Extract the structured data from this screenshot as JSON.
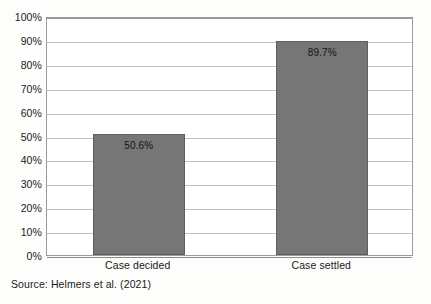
{
  "chart_data": {
    "type": "bar",
    "title": "",
    "subtitle": "",
    "xlabel": "",
    "ylabel": "",
    "categories": [
      "Case decided",
      "Case settled"
    ],
    "values": [
      50.6,
      89.7
    ],
    "data_labels": [
      "50.6%",
      "89.7%"
    ],
    "ylim": [
      0,
      100
    ],
    "y_tick_values": [
      0,
      10,
      20,
      30,
      40,
      50,
      60,
      70,
      80,
      90,
      100
    ],
    "y_tick_labels": [
      "0%",
      "10%",
      "20%",
      "30%",
      "40%",
      "50%",
      "60%",
      "70%",
      "80%",
      "90%",
      "100%"
    ],
    "grid": "horizontal",
    "legend": "none",
    "bar_color": "#767676",
    "bar_border_color": "#5e5e5e",
    "gridline_color": "#c2c2c2",
    "axis_color": "#9a9a9a",
    "text_color": "#1a1a1a",
    "plot_background": "#ffffff",
    "figure_background": "#fdfdfc"
  },
  "footer": {
    "source_note": "Source: Helmers et al. (2021)"
  }
}
